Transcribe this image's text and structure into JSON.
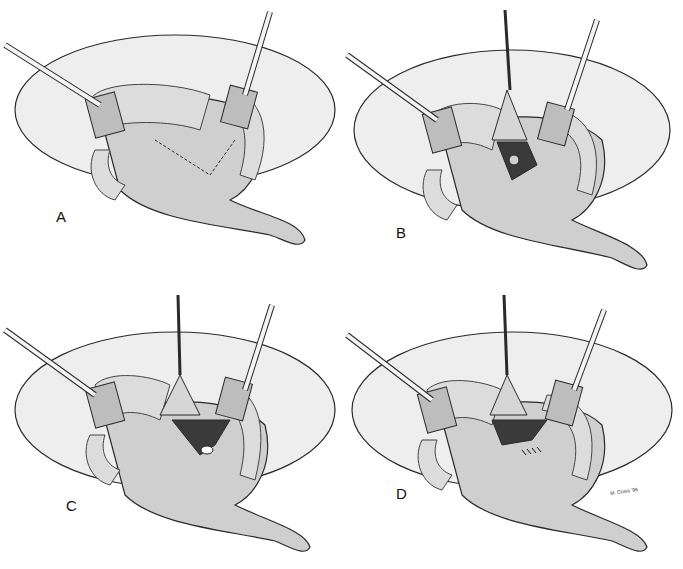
{
  "figure": {
    "panels": [
      {
        "label": "A",
        "step": "planned incision outlined with dashed line"
      },
      {
        "label": "B",
        "step": "flap retracted upward exposing stone"
      },
      {
        "label": "C",
        "step": "flap retracted, stone visible in opening"
      },
      {
        "label": "D",
        "step": "closure with sutures"
      }
    ],
    "signature": "M. Cross '96"
  },
  "colors": {
    "line": "#2a2a2a",
    "kidney_fill": "#e6e6e6",
    "pelvis_fill": "#cfcfcf",
    "fat_fill": "#dcdcdc",
    "retractor": "#bdbdbd",
    "background": "#ffffff"
  }
}
